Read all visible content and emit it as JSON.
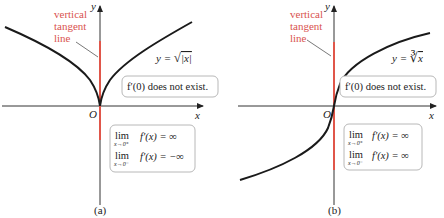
{
  "colors": {
    "curve": "#1a1a1a",
    "axis": "#333333",
    "tangent": "#e0564a",
    "annotation": "#d9534f",
    "box_border": "#b8b8b8",
    "box_fill": "#ffffff"
  },
  "panels": [
    {
      "id": "a",
      "caption": "(a)",
      "y_axis_label": "y",
      "x_axis_label": "x",
      "origin_label": "O",
      "annotation": [
        "vertical",
        "tangent",
        "line"
      ],
      "function_label": "y = √|x|",
      "function_prefix": "y = ",
      "function_radical": "√",
      "function_radicand": "|x|",
      "derivative_note": "f′(0) does not exist.",
      "limits": [
        {
          "lim": "lim",
          "sub": "x→0⁺",
          "expr": "f′(x) = ∞"
        },
        {
          "lim": "lim",
          "sub": "x→0⁻",
          "expr": "f′(x) = −∞"
        }
      ]
    },
    {
      "id": "b",
      "caption": "(b)",
      "y_axis_label": "y",
      "x_axis_label": "x",
      "origin_label": "O",
      "annotation": [
        "vertical",
        "tangent",
        "line"
      ],
      "function_label": "y = ∛x",
      "function_prefix": "y = ",
      "function_radical": "∛",
      "function_radicand": "x",
      "derivative_note": "f′(0) does not exist.",
      "limits": [
        {
          "lim": "lim",
          "sub": "x→0⁺",
          "expr": "f′(x) = ∞"
        },
        {
          "lim": "lim",
          "sub": "x→0⁻",
          "expr": "f′(x) = ∞"
        }
      ]
    }
  ]
}
